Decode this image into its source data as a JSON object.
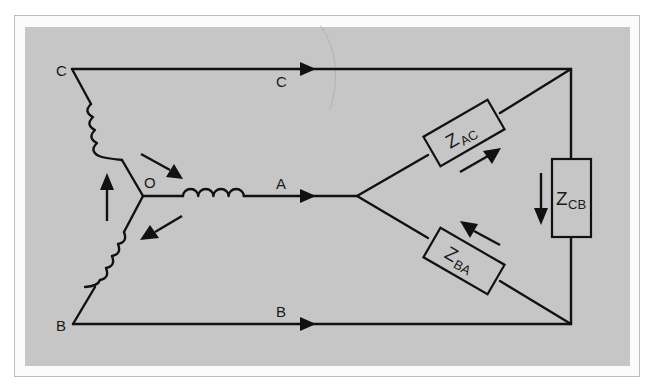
{
  "diagram": {
    "type": "three-phase star (wye) source feeding delta load",
    "colors": {
      "background": "#c6c6c6",
      "frame": "#bdbdbd",
      "ink": "#111111"
    },
    "source": {
      "neutral_label": "O",
      "phases": [
        {
          "name": "C",
          "node_label": "C",
          "line_label": "C"
        },
        {
          "name": "A",
          "node_label": "",
          "line_label": "A"
        },
        {
          "name": "B",
          "node_label": "B",
          "line_label": "B"
        }
      ]
    },
    "load": {
      "impedances": [
        {
          "symbol": "Z",
          "subscript": "AC"
        },
        {
          "symbol": "Z",
          "subscript": "CB"
        },
        {
          "symbol": "Z",
          "subscript": "BA"
        }
      ]
    },
    "labels": {
      "node_c": "C",
      "node_b": "B",
      "neutral": "O",
      "line_c": "C",
      "line_a": "A",
      "line_b": "B",
      "z": "Z",
      "z_ac_sub": "AC",
      "z_cb_sub": "CB",
      "z_ba_sub": "BA"
    }
  }
}
